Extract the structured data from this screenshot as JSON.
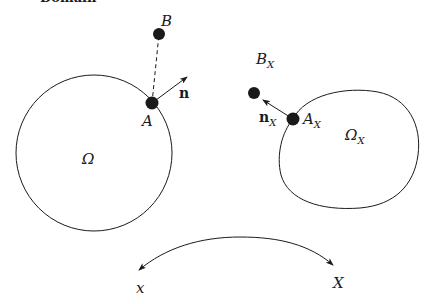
{
  "header": {
    "partial_text": "Domain"
  },
  "left_domain": {
    "region_label": "Ω",
    "point_A_label": "A",
    "point_B_label": "B",
    "normal_label": "n"
  },
  "right_domain": {
    "region_label": "Ω",
    "region_sub": "X",
    "point_A_label": "A",
    "point_A_sub": "X",
    "point_B_label": "B",
    "point_B_sub": "X",
    "normal_label": "n",
    "normal_sub": "X"
  },
  "mapping": {
    "left_label": "x",
    "right_label": "X"
  },
  "colors": {
    "stroke": "#1a1a1a",
    "background": "#ffffff"
  }
}
